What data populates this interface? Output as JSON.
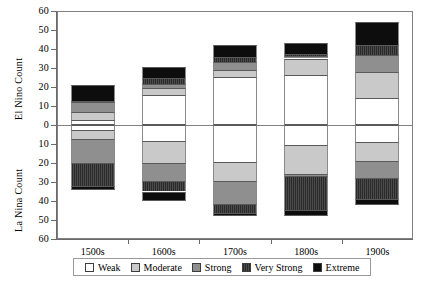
{
  "chart_data": {
    "type": "bar",
    "title": "",
    "subtitle": "",
    "stacked": true,
    "orientation": "vertical",
    "diverging": true,
    "grid": false,
    "legend_position": "bottom",
    "xlabel": "",
    "ylabel_top": "El Nino Count",
    "ylabel_bottom": "La Nina Count",
    "categories": [
      "1500s",
      "1600s",
      "1700s",
      "1800s",
      "1900s"
    ],
    "xtick_labels": [
      "1500s",
      "1600s",
      "1700s",
      "1800s",
      "1900s"
    ],
    "ylim_top": [
      0,
      60
    ],
    "ylim_bottom": [
      0,
      60
    ],
    "ytick_labels_top": [
      "60",
      "50",
      "40",
      "30",
      "20",
      "10",
      "0"
    ],
    "ytick_labels_bottom": [
      "10",
      "20",
      "30",
      "40",
      "50",
      "60"
    ],
    "ytick_values_top": [
      60,
      50,
      40,
      30,
      20,
      10,
      0
    ],
    "ytick_values_bottom": [
      10,
      20,
      30,
      40,
      50,
      60
    ],
    "legend": [
      "Weak",
      "Moderate",
      "Strong",
      "Very Strong",
      "Extreme"
    ],
    "series_colors": {
      "Weak": "#ffffff",
      "Moderate": "#c9c9c9",
      "Strong": "#8f8f8f",
      "Very Strong": "#3a3a3a",
      "Extreme": "#0d0d0d"
    },
    "el_nino": {
      "label": "El Nino Count",
      "totals": [
        21,
        30.5,
        42,
        43,
        54
      ],
      "series": [
        {
          "name": "Weak",
          "values": [
            2.5,
            16,
            25.5,
            26.5,
            14
          ]
        },
        {
          "name": "Moderate",
          "values": [
            4.5,
            3.5,
            3.5,
            8.5,
            14
          ]
        },
        {
          "name": "Strong",
          "values": [
            5,
            2,
            4,
            1.5,
            9
          ]
        },
        {
          "name": "Very Strong",
          "values": [
            0.5,
            3,
            3,
            1,
            5
          ]
        },
        {
          "name": "Extreme",
          "values": [
            8.5,
            6,
            6,
            5.5,
            12
          ]
        }
      ]
    },
    "la_nina": {
      "label": "La Nina Count",
      "totals": [
        34,
        40,
        48,
        48,
        42
      ],
      "series": [
        {
          "name": "Weak",
          "values": [
            2.5,
            8.5,
            19.5,
            10.5,
            9
          ]
        },
        {
          "name": "Moderate",
          "values": [
            5,
            11.5,
            10,
            15.5,
            10
          ]
        },
        {
          "name": "Strong",
          "values": [
            12.5,
            9.5,
            12,
            1,
            9
          ]
        },
        {
          "name": "Very Strong",
          "values": [
            12,
            5.5,
            5,
            17.5,
            11
          ]
        },
        {
          "name": "Extreme",
          "values": [
            2,
            5,
            1.5,
            3.5,
            3
          ]
        }
      ]
    }
  }
}
